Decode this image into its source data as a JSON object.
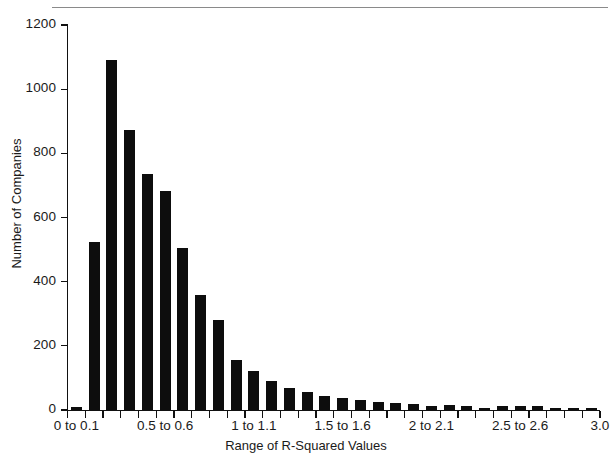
{
  "chart_data": {
    "type": "bar",
    "title": "",
    "xlabel": "Range of R-Squared Values",
    "ylabel": "Number of Companies",
    "ylim": [
      0,
      1200
    ],
    "xlim": [
      0,
      3.0
    ],
    "grid": false,
    "legend": null,
    "bar_color": "#0d0d0d",
    "y_ticks": [
      0,
      200,
      400,
      600,
      800,
      1000,
      1200
    ],
    "y_tick_labels": [
      "0",
      "200",
      "400",
      "600",
      "800",
      "1000",
      "1200"
    ],
    "x_tick_labels": [
      {
        "value": 0.05,
        "label": "0 to 0.1"
      },
      {
        "value": 0.55,
        "label": "0.5 to 0.6"
      },
      {
        "value": 1.05,
        "label": "1 to 1.1"
      },
      {
        "value": 1.55,
        "label": "1.5 to 1.6"
      },
      {
        "value": 2.05,
        "label": "2 to 2.1"
      },
      {
        "value": 2.55,
        "label": "2.5 to 2.6"
      },
      {
        "value": 3.0,
        "label": "3.0"
      }
    ],
    "bin_width": 0.1,
    "categories": [
      "0 to 0.1",
      "0.1 to 0.2",
      "0.2 to 0.3",
      "0.3 to 0.4",
      "0.4 to 0.5",
      "0.5 to 0.6",
      "0.6 to 0.7",
      "0.7 to 0.8",
      "0.8 to 0.9",
      "0.9 to 1",
      "1 to 1.1",
      "1.1 to 1.2",
      "1.2 to 1.3",
      "1.3 to 1.4",
      "1.4 to 1.5",
      "1.5 to 1.6",
      "1.6 to 1.7",
      "1.7 to 1.8",
      "1.8 to 1.9",
      "1.9 to 2",
      "2 to 2.1",
      "2.1 to 2.2",
      "2.2 to 2.3",
      "2.3 to 2.4",
      "2.4 to 2.5",
      "2.5 to 2.6",
      "2.6 to 2.7",
      "2.7 to 2.8",
      "2.8 to 2.9",
      "2.9 to 3"
    ],
    "values": [
      8,
      525,
      1090,
      872,
      735,
      682,
      505,
      357,
      280,
      156,
      122,
      90,
      69,
      56,
      44,
      38,
      30,
      25,
      22,
      20,
      14,
      16,
      12,
      5,
      14,
      13,
      11,
      7,
      3,
      2
    ]
  },
  "axis": {
    "x_title": "Range of R-Squared Values",
    "y_title": "Number of Companies"
  },
  "footer": {
    "smudge": ""
  }
}
